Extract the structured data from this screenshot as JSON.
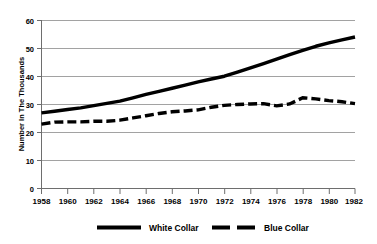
{
  "chart_data": {
    "type": "line",
    "title": "",
    "subtitle": "",
    "xlabel": "",
    "ylabel": "Number In The Thousands",
    "xlim": [
      1958,
      1982
    ],
    "ylim": [
      0,
      60
    ],
    "grid": true,
    "grid_axis": "y",
    "legend_position": "bottom",
    "x": [
      1958,
      1959,
      1960,
      1961,
      1962,
      1963,
      1964,
      1965,
      1966,
      1967,
      1968,
      1969,
      1970,
      1971,
      1972,
      1973,
      1974,
      1975,
      1976,
      1977,
      1978,
      1979,
      1980,
      1981,
      1982
    ],
    "xticks": [
      1958,
      1960,
      1962,
      1964,
      1966,
      1968,
      1970,
      1972,
      1974,
      1976,
      1978,
      1980,
      1982
    ],
    "yticks": [
      0,
      10,
      20,
      30,
      40,
      50,
      60
    ],
    "series": [
      {
        "name": "White Collar",
        "style": "solid",
        "color": "#000000",
        "values": [
          27.0,
          27.6,
          28.2,
          28.8,
          29.6,
          30.4,
          31.2,
          32.4,
          33.6,
          34.7,
          35.8,
          36.9,
          38.1,
          39.1,
          40.1,
          41.6,
          43.1,
          44.6,
          46.2,
          47.8,
          49.3,
          50.8,
          52.0,
          53.1,
          54.1
        ]
      },
      {
        "name": "Blue Collar",
        "style": "dashed",
        "color": "#000000",
        "values": [
          23.0,
          23.7,
          23.8,
          23.8,
          24.0,
          24.0,
          24.4,
          25.2,
          26.0,
          26.8,
          27.4,
          27.7,
          28.1,
          29.0,
          29.7,
          30.0,
          30.2,
          30.3,
          29.5,
          30.2,
          32.4,
          32.0,
          31.4,
          31.0,
          30.3
        ]
      }
    ]
  },
  "axis": {
    "y_title": "Number In The Thousands",
    "y_tick_labels": [
      "60",
      "50",
      "40",
      "30",
      "20",
      "10",
      "0"
    ],
    "x_tick_labels": [
      "1958",
      "1960",
      "1962",
      "1964",
      "1966",
      "1968",
      "1970",
      "1972",
      "1974",
      "1976",
      "1978",
      "1980",
      "1982"
    ]
  },
  "legend": {
    "items": [
      {
        "label": "White Collar",
        "swatch": "solid-line-swatch"
      },
      {
        "label": "Blue Collar",
        "swatch": "dashed-line-swatch"
      }
    ]
  }
}
